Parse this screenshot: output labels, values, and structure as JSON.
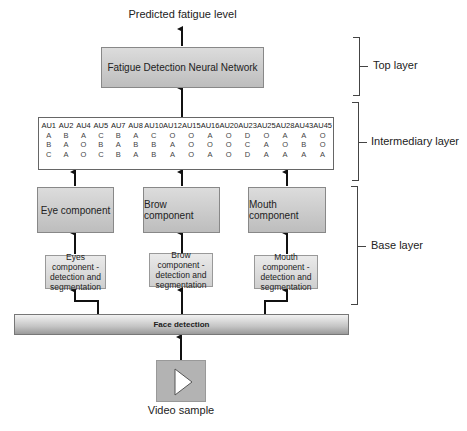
{
  "output_label": "Predicted fatigue level",
  "top": {
    "network_label": "Fatigue Detection Neural Network"
  },
  "au_table": {
    "headers": [
      "AU1",
      "AU2",
      "AU4",
      "AU5",
      "AU7",
      "AU8",
      "AU10",
      "AU12",
      "AU15",
      "AU16",
      "AU20",
      "AU23",
      "AU25",
      "AU28",
      "AU43",
      "AU45"
    ],
    "rows": [
      [
        "A",
        "B",
        "A",
        "C",
        "B",
        "A",
        "C",
        "O",
        "O",
        "A",
        "O",
        "D",
        "O",
        "A",
        "A",
        "O"
      ],
      [
        "B",
        "A",
        "O",
        "B",
        "A",
        "B",
        "B",
        "A",
        "O",
        "O",
        "O",
        "C",
        "A",
        "O",
        "B",
        "O"
      ],
      [
        "C",
        "A",
        "O",
        "C",
        "B",
        "A",
        "B",
        "A",
        "O",
        "A",
        "O",
        "D",
        "A",
        "A",
        "A",
        "A"
      ]
    ]
  },
  "components": [
    {
      "name": "Eye component",
      "detection": "Eyes component - detection and segmentation"
    },
    {
      "name": "Brow component",
      "detection": "Brow component - detection and segmentation"
    },
    {
      "name": "Mouth component",
      "detection": "Mouth component - detection and segmentation"
    }
  ],
  "face_detection_label": "Face detection",
  "video_label": "Video sample",
  "layers": {
    "top": "Top layer",
    "intermediary": "Intermediary layer",
    "base": "Base layer"
  }
}
